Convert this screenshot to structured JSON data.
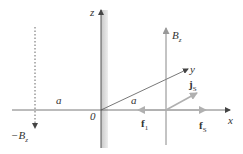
{
  "diagram": {
    "type": "physics-vector-diagram",
    "axes": {
      "z_label": "z",
      "y_label": "y",
      "x_label": "x",
      "origin_label": "0"
    },
    "distance_labels": {
      "left": "a",
      "diagonal": "a"
    },
    "field_labels": {
      "bz_main": "B",
      "bz_main_sub": "z",
      "bz_neg_prefix": "−B",
      "bz_neg_sub": "z"
    },
    "vectors": {
      "js_main": "j",
      "js_sub": "S",
      "f1_main": "f",
      "f1_sub": "1",
      "fs_main": "f",
      "fs_sub": "S"
    },
    "colors": {
      "axis": "#555555",
      "light_vector": "#aaaaaa",
      "wall_shade": "#cfcfcf",
      "text": "#333333"
    }
  }
}
